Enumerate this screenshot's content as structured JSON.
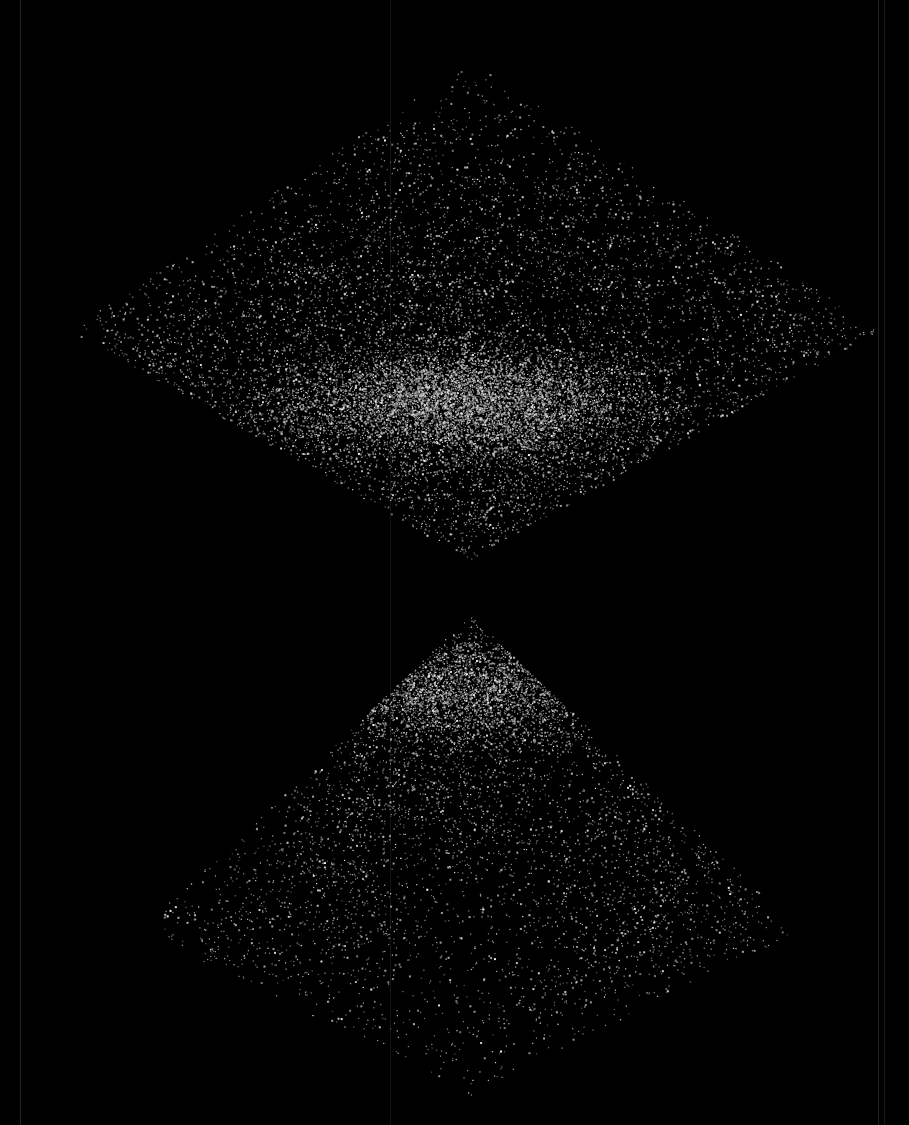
{
  "image": {
    "width": 909,
    "height": 1125,
    "background": "#000000",
    "point_color": "#d8d8d8",
    "description": "Galaxy redshift survey: two opposing wedge-shaped slices of large-scale structure"
  },
  "wedges": [
    {
      "name": "upper-wedge",
      "apex": [
        470,
        560
      ],
      "apex_direction": "down",
      "far_edge_y": 60,
      "left_x": 70,
      "right_x": 880,
      "widest_y": 330,
      "dense_core": [
        460,
        400
      ],
      "points": 26000
    },
    {
      "name": "lower-wedge",
      "apex": [
        470,
        615
      ],
      "apex_direction": "up",
      "far_edge_y": 1095,
      "left_x": 140,
      "right_x": 800,
      "widest_y": 930,
      "dense_core": [
        470,
        690
      ],
      "points": 15000
    }
  ],
  "scan_lines": [
    {
      "x": 20,
      "opacity": 0.18
    },
    {
      "x": 390,
      "opacity": 0.1
    },
    {
      "x": 878,
      "opacity": 0.16
    },
    {
      "x": 884,
      "opacity": 0.12
    }
  ]
}
